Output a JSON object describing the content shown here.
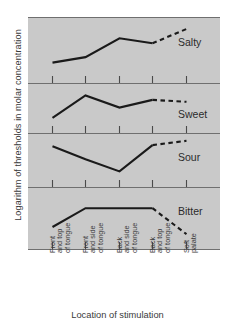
{
  "chart_data": {
    "type": "line",
    "title": "",
    "ylabel": "Logarithm of thresholds in molar concentration",
    "xlabel": "Location of stimulation",
    "grid": false,
    "legend_position": "inline-right",
    "categories": [
      "Front and top of tongue",
      "Front and side of tongue",
      "Back and side of tongue",
      "Back and top of tongue",
      "Soft palate"
    ],
    "category_lines": [
      [
        "Front",
        "and top",
        "of tongue"
      ],
      [
        "Front",
        "and side",
        "of tongue"
      ],
      [
        "Back",
        "and side",
        "of tongue"
      ],
      [
        "Back",
        "and top",
        "of tongue"
      ],
      [
        "Soft",
        "palate"
      ]
    ],
    "series": [
      {
        "name": "Salty",
        "values": [
          0.2,
          0.33,
          0.78,
          0.66,
          1.0
        ],
        "solid_through_index": 3,
        "dashed_tail": true
      },
      {
        "name": "Sweet",
        "values": [
          0.1,
          0.8,
          0.42,
          0.66,
          0.6
        ],
        "solid_through_index": 3,
        "dashed_tail": true
      },
      {
        "name": "Sour",
        "values": [
          0.8,
          0.44,
          0.1,
          0.83,
          0.95
        ],
        "solid_through_index": 3,
        "dashed_tail": true
      },
      {
        "name": "Bitter",
        "values": [
          0.25,
          0.72,
          0.72,
          0.72,
          0.07
        ],
        "solid_through_index": 3,
        "dashed_tail": true
      }
    ],
    "axis_note": "Each taste shown in its own stacked panel; vertical scale is relative log threshold, unlabeled ticks."
  },
  "colors": {
    "plot_background": "#c9c9c9",
    "line": "#1a1a1a",
    "panel_divider": "#6f6f6f",
    "text": "#3a3a3a",
    "page_background": "#ffffff"
  },
  "labels": {
    "salty": "Salty",
    "sweet": "Sweet",
    "sour": "Sour",
    "bitter": "Bitter"
  }
}
